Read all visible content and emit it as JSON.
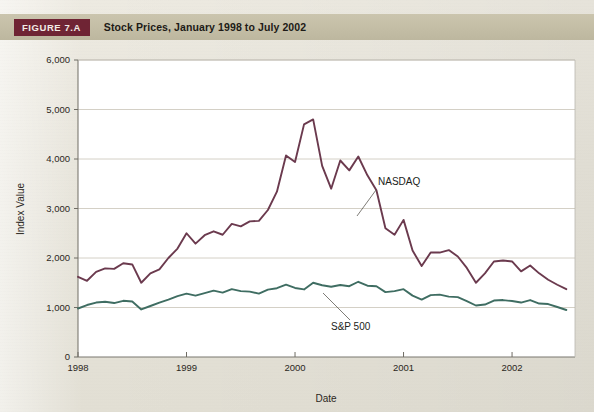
{
  "figure": {
    "tag": "FIGURE 7.A",
    "title": "Stock Prices, January 1998 to July 2002"
  },
  "chart_data": {
    "type": "line",
    "title": "Stock Prices, January 1998 to July 2002",
    "xlabel": "Date",
    "ylabel": "Index Value",
    "xlim": [
      1998.0,
      2002.58
    ],
    "ylim": [
      0,
      6000
    ],
    "ytick_labels": [
      "0",
      "1,000",
      "2,000",
      "3,000",
      "4,000",
      "5,000",
      "6,000"
    ],
    "ytick_values": [
      0,
      1000,
      2000,
      3000,
      4000,
      5000,
      6000
    ],
    "xtick_labels": [
      "1998",
      "1999",
      "2000",
      "2001",
      "2002"
    ],
    "xtick_values": [
      1998,
      1999,
      2000,
      2001,
      2002
    ],
    "grid": "horizontal",
    "legend_position": "inline-annotation",
    "x": [
      1998.0,
      1998.083,
      1998.167,
      1998.25,
      1998.333,
      1998.417,
      1998.5,
      1998.583,
      1998.667,
      1998.75,
      1998.833,
      1998.917,
      1999.0,
      1999.083,
      1999.167,
      1999.25,
      1999.333,
      1999.417,
      1999.5,
      1999.583,
      1999.667,
      1999.75,
      1999.833,
      1999.917,
      2000.0,
      2000.083,
      2000.167,
      2000.25,
      2000.333,
      2000.417,
      2000.5,
      2000.583,
      2000.667,
      2000.75,
      2000.833,
      2000.917,
      2001.0,
      2001.083,
      2001.167,
      2001.25,
      2001.333,
      2001.417,
      2001.5,
      2001.583,
      2001.667,
      2001.75,
      2001.833,
      2001.917,
      2002.0,
      2002.083,
      2002.167,
      2002.25,
      2002.333,
      2002.417,
      2002.5
    ],
    "series": [
      {
        "name": "NASDAQ",
        "color": "#6b3a4e",
        "values": [
          1620,
          1540,
          1720,
          1790,
          1780,
          1895,
          1870,
          1500,
          1690,
          1770,
          2000,
          2190,
          2500,
          2290,
          2460,
          2540,
          2470,
          2690,
          2640,
          2740,
          2750,
          2970,
          3340,
          4070,
          3940,
          4700,
          4800,
          3860,
          3400,
          3970,
          3770,
          4050,
          3670,
          3370,
          2600,
          2470,
          2770,
          2150,
          1840,
          2110,
          2110,
          2160,
          2030,
          1800,
          1500,
          1690,
          1930,
          1950,
          1930,
          1730,
          1850,
          1690,
          1560,
          1460,
          1370
        ]
      },
      {
        "name": "S&P 500",
        "color": "#3f6d62",
        "values": [
          980,
          1050,
          1100,
          1115,
          1090,
          1135,
          1120,
          960,
          1030,
          1100,
          1160,
          1230,
          1280,
          1240,
          1290,
          1340,
          1300,
          1370,
          1330,
          1320,
          1280,
          1360,
          1390,
          1460,
          1395,
          1365,
          1500,
          1450,
          1420,
          1455,
          1430,
          1520,
          1440,
          1430,
          1310,
          1330,
          1370,
          1240,
          1160,
          1250,
          1260,
          1220,
          1210,
          1130,
          1040,
          1060,
          1140,
          1150,
          1130,
          1100,
          1150,
          1080,
          1070,
          1010,
          950
        ]
      }
    ],
    "annotations": [
      {
        "text": "NASDAQ",
        "series": "NASDAQ"
      },
      {
        "text": "S&P 500",
        "series": "S&P 500"
      }
    ]
  }
}
